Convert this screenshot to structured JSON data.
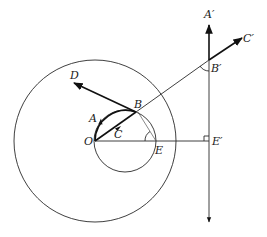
{
  "figure": {
    "type": "geometry-diagram",
    "labels": {
      "O": "O",
      "A": "A",
      "B": "B",
      "C": "C",
      "D": "D",
      "E": "E",
      "A_prime": "A′",
      "B_prime": "B′",
      "C_prime": "C′",
      "E_prime": "E′"
    },
    "points": {
      "O": [
        95,
        141
      ],
      "B": [
        136,
        112
      ],
      "E": [
        156,
        141
      ],
      "D": [
        73,
        82
      ],
      "B_prime": [
        209,
        60
      ],
      "C_prime": [
        242,
        38
      ],
      "E_prime": [
        209,
        141
      ],
      "A_prime": [
        209,
        25
      ]
    },
    "circles": {
      "small": {
        "center": [
          125,
          141
        ],
        "radius": 31
      },
      "large": {
        "center": [
          95,
          141
        ],
        "radius": 81
      }
    },
    "vertical_line": {
      "x": 209,
      "y_top": 25,
      "y_bottom": 222
    },
    "marks": {
      "right_angle_at": "E′",
      "angle_arcs": [
        "E",
        "B′"
      ]
    },
    "colors": {
      "stroke": "#111111",
      "background": "#ffffff"
    }
  }
}
